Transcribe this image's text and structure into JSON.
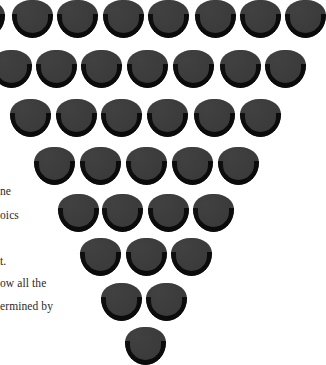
{
  "text_fragments": [
    {
      "text": "ne",
      "x": 0,
      "y": 185
    },
    {
      "text": "oics",
      "x": 0,
      "y": 209
    },
    {
      "text": "t.",
      "x": 0,
      "y": 255
    },
    {
      "text": "ow all the",
      "x": 0,
      "y": 277
    },
    {
      "text": "ermined  by",
      "x": 0,
      "y": 300
    }
  ],
  "shape_style": {
    "fill": "#3b3b3b",
    "rim": "#0b0b0b",
    "background": "#ffffff"
  },
  "shape_rows": [
    {
      "y": 0,
      "xs": [
        -36,
        12,
        57,
        103,
        148,
        195,
        240,
        285
      ]
    },
    {
      "y": 50,
      "xs": [
        -9,
        36,
        81,
        127,
        173,
        220,
        265
      ]
    },
    {
      "y": 99,
      "xs": [
        10,
        56,
        101,
        147,
        194,
        240
      ]
    },
    {
      "y": 147,
      "xs": [
        34,
        80,
        126,
        172,
        218
      ]
    },
    {
      "y": 194,
      "xs": [
        58,
        102,
        148,
        193
      ]
    },
    {
      "y": 238,
      "xs": [
        80,
        126,
        171
      ]
    },
    {
      "y": 283,
      "xs": [
        101,
        146
      ]
    },
    {
      "y": 327,
      "xs": [
        125
      ]
    }
  ]
}
